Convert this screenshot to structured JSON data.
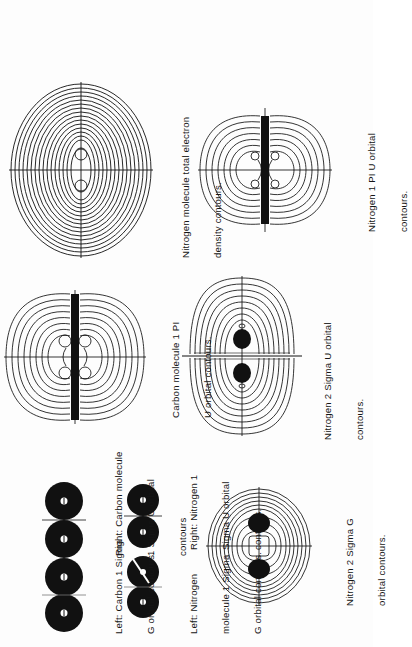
{
  "page": {
    "orientation": "rotated-90-ccw",
    "background": "#fdfdfd",
    "ink": "#111111"
  },
  "figures": [
    {
      "id": "n2-total-density",
      "title": "Nitrogen molecule total electron density contours.",
      "caption_lines": [
        "Nitrogen molecule total electron",
        "density contours."
      ]
    },
    {
      "id": "n2-1piu",
      "title": "Nitrogen 1 Pi U orbital contours.",
      "caption_lines": [
        "Nitrogen 1 PI U orbital",
        "contours."
      ]
    },
    {
      "id": "c2-1piu",
      "title": "Carbon molecule 1 Pi U orbital contours.",
      "caption_lines": [
        "Carbon molecule 1 PI",
        "U orbital contours."
      ]
    },
    {
      "id": "n2-2sigmau",
      "title": "Nitrogen 2 Sigma U orbital contours.",
      "caption_lines": [
        "Nitrogen 2 Sigma U orbital",
        "contours."
      ]
    },
    {
      "id": "n2-2sigmag",
      "title": "Nitrogen 2 Sigma G orbital contours.",
      "caption_lines": [
        "Nitrogen 2 Sigma G",
        "orbital contours."
      ]
    },
    {
      "id": "c2-1sigmag",
      "title": "Carbon 1 Sigma G orbital contours."
    },
    {
      "id": "c2-1sigmau",
      "title": "Carbon molecule 1 Sigma U orbital contours"
    },
    {
      "id": "n2-1sigmag",
      "title": "Nitrogen molecule 1 Sigma G orbital contours."
    },
    {
      "id": "n2-1sigmau",
      "title": "Nitrogen 1 Sigma U orbital contours."
    }
  ],
  "captions": {
    "carbon_1sigma": {
      "left_lines": [
        "Left: Carbon 1 Sigma",
        "G orbital contours."
      ],
      "right_lines": [
        "Right: Carbon molecule",
        "1 Sigma U orbital",
        "contours"
      ]
    },
    "nitrogen_1sigma": {
      "left_lines": [
        "Left: Nitrogen",
        "molecule 1 Sigma",
        "G orbital contours."
      ],
      "right_lines": [
        "Right: Nitrogen 1",
        "Sigma U orbital",
        "contours."
      ]
    }
  }
}
